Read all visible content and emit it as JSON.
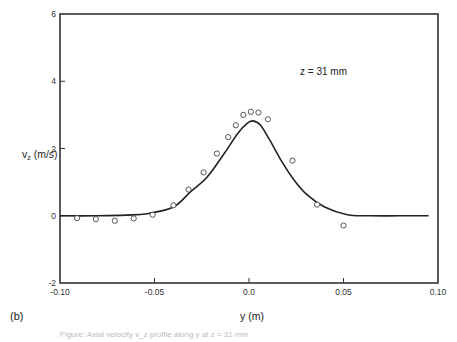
{
  "chart_data": {
    "type": "scatter",
    "title": "",
    "panel_label": "(b)",
    "annotation": "z = 31 mm",
    "xlabel": "y (m)",
    "ylabel": "v",
    "ylabel_subscript": "z",
    "ylabel_units": " (m/s)",
    "xlim": [
      -0.1,
      0.1
    ],
    "ylim": [
      -2,
      6
    ],
    "xticks": [
      -0.1,
      -0.05,
      0.0,
      0.05,
      0.1
    ],
    "xtick_labels": [
      "-0.10",
      "-0.05",
      "0.0",
      "0.05",
      "0.10"
    ],
    "yticks": [
      -2,
      0,
      2,
      4,
      6
    ],
    "ytick_labels": [
      "-2",
      "0",
      "2",
      "4",
      "6"
    ],
    "grid": false,
    "legend": "none",
    "series": [
      {
        "name": "measured",
        "kind": "scatter",
        "marker": "open-circle",
        "x": [
          -0.091,
          -0.081,
          -0.071,
          -0.061,
          -0.051,
          -0.04,
          -0.032,
          -0.024,
          -0.017,
          -0.011,
          -0.007,
          -0.003,
          0.001,
          0.005,
          0.01,
          0.023,
          0.036,
          0.05
        ],
        "y": [
          -0.07,
          -0.1,
          -0.15,
          -0.08,
          0.03,
          0.31,
          0.78,
          1.29,
          1.85,
          2.34,
          2.69,
          3.0,
          3.09,
          3.07,
          2.87,
          1.64,
          0.33,
          -0.29
        ]
      },
      {
        "name": "model",
        "kind": "line",
        "x": [
          -0.1,
          -0.08,
          -0.065,
          -0.054,
          -0.04,
          -0.031,
          -0.022,
          -0.013,
          -0.006,
          -0.001,
          0.002,
          0.006,
          0.011,
          0.017,
          0.024,
          0.031,
          0.04,
          0.052,
          0.063,
          0.08,
          0.095
        ],
        "y": [
          0.0,
          0.0,
          0.02,
          0.06,
          0.26,
          0.71,
          1.16,
          1.86,
          2.45,
          2.75,
          2.82,
          2.7,
          2.25,
          1.65,
          1.05,
          0.61,
          0.26,
          0.03,
          0.0,
          0.0,
          0.0
        ]
      }
    ]
  },
  "caption": "Figure: Axial velocity v_z profile along y at z = 31 mm"
}
